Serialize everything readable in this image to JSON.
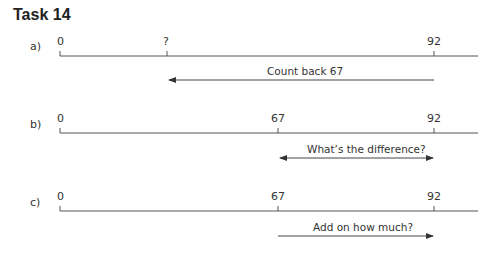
{
  "title": "Task 14",
  "colors": {
    "line": "#555555",
    "text": "#333333"
  },
  "parts": [
    {
      "label": "a)",
      "ticks": [
        {
          "label": "0",
          "x": 60
        },
        {
          "label": "?",
          "x": 167
        },
        {
          "label": "92",
          "x": 434
        }
      ],
      "arrow": {
        "text": "Count back 67",
        "from": 434,
        "to": 168,
        "direction": "left"
      }
    },
    {
      "label": "b)",
      "ticks": [
        {
          "label": "0",
          "x": 60
        },
        {
          "label": "67",
          "x": 278
        },
        {
          "label": "92",
          "x": 434
        }
      ],
      "arrow": {
        "text": "What’s the difference?",
        "from": 278,
        "to": 434,
        "direction": "both"
      }
    },
    {
      "label": "c)",
      "ticks": [
        {
          "label": "0",
          "x": 60
        },
        {
          "label": "67",
          "x": 278
        },
        {
          "label": "92",
          "x": 434
        }
      ],
      "arrow": {
        "text": "Add on how much?",
        "from": 278,
        "to": 434,
        "direction": "right"
      }
    }
  ]
}
